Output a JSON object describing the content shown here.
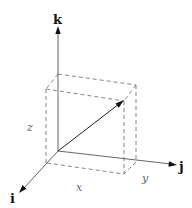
{
  "diagram": {
    "title": "",
    "axes": {
      "i": {
        "label": "i"
      },
      "j": {
        "label": "j"
      },
      "k": {
        "label": "k"
      }
    },
    "components": {
      "x": {
        "label": "x"
      },
      "y": {
        "label": "y"
      },
      "z": {
        "label": "z"
      }
    },
    "colors": {
      "axis": "#555555",
      "vector": "#222222",
      "dashed_box": "#777777",
      "axis_label": "#111111",
      "component_label": "#666666"
    }
  }
}
